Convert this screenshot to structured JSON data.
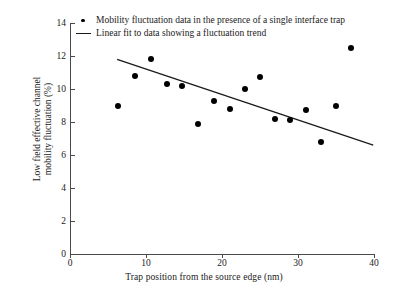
{
  "chart_data": {
    "type": "scatter",
    "title": "",
    "xlabel": "Trap position from the source edge (nm)",
    "ylabel": "Low field effective channel mobility fluctuation (%)",
    "ylabel_line1": "Low field effective channel",
    "ylabel_line2": "mobility fluctuation (%)",
    "xlim": [
      0,
      40
    ],
    "ylim": [
      0,
      14
    ],
    "xticks": [
      0,
      10,
      20,
      30,
      40
    ],
    "yticks": [
      0,
      2,
      4,
      6,
      8,
      10,
      12,
      14
    ],
    "grid": false,
    "legend_position": "top-left",
    "series": [
      {
        "name": "Mobility fluctuation data in the presence of a single interface trap",
        "type": "scatter",
        "marker": "filled-circle",
        "color": "#000000",
        "points": [
          {
            "x": 6.3,
            "y": 9.0
          },
          {
            "x": 8.6,
            "y": 10.8
          },
          {
            "x": 10.7,
            "y": 11.8
          },
          {
            "x": 12.8,
            "y": 10.3
          },
          {
            "x": 14.8,
            "y": 10.2
          },
          {
            "x": 16.9,
            "y": 7.9
          },
          {
            "x": 19.0,
            "y": 9.3
          },
          {
            "x": 21.0,
            "y": 8.8
          },
          {
            "x": 23.0,
            "y": 10.0
          },
          {
            "x": 25.0,
            "y": 10.7
          },
          {
            "x": 27.0,
            "y": 8.2
          },
          {
            "x": 29.0,
            "y": 8.1
          },
          {
            "x": 31.0,
            "y": 8.75
          },
          {
            "x": 33.0,
            "y": 6.8
          },
          {
            "x": 35.0,
            "y": 9.0
          },
          {
            "x": 37.0,
            "y": 12.5
          }
        ]
      },
      {
        "name": "Linear fit to data showing a fluctuation trend",
        "type": "line",
        "color": "#1a1a1a",
        "endpoints": [
          {
            "x": 6.2,
            "y": 11.8
          },
          {
            "x": 39.9,
            "y": 6.6
          }
        ]
      }
    ],
    "legend": [
      {
        "key": "filled-circle",
        "label": "Mobility fluctuation data in the presence of a single interface trap"
      },
      {
        "key": "line",
        "label": "Linear fit to data showing a fluctuation trend"
      }
    ]
  }
}
